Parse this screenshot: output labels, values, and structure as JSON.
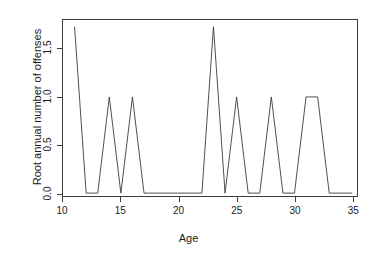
{
  "chart_data": {
    "type": "line",
    "title": "",
    "subtitle": "",
    "xlabel": "Age",
    "ylabel": "Root annual number of offenses",
    "xlim": [
      10,
      35.4
    ],
    "ylim": [
      -0.03,
      1.8
    ],
    "grid": false,
    "legend": null,
    "legend_position": "none",
    "x_ticks": [
      10,
      15,
      20,
      25,
      30,
      35
    ],
    "x_tick_labels": [
      "10",
      "15",
      "20",
      "25",
      "30",
      "35"
    ],
    "y_ticks": [
      0.0,
      0.5,
      1.0,
      1.5
    ],
    "y_tick_labels": [
      "0.0",
      "0.5",
      "1.0",
      "1.5"
    ],
    "line_color": "#3c3c3c",
    "line_width": 0.9,
    "frame_color": "#3c3c3c",
    "background_color": "#ffffff",
    "x": [
      11,
      12,
      13,
      14,
      15,
      16,
      17,
      18,
      19,
      20,
      21,
      22,
      23,
      24,
      25,
      26,
      27,
      28,
      29,
      30,
      31,
      32,
      33,
      34,
      35
    ],
    "values": [
      1.73,
      0.0,
      0.0,
      1.0,
      0.0,
      1.0,
      0.0,
      0.0,
      0.0,
      0.0,
      0.0,
      0.0,
      1.73,
      0.0,
      1.0,
      0.0,
      0.0,
      1.0,
      0.0,
      0.0,
      1.0,
      1.0,
      0.0,
      0.0,
      0.0
    ],
    "series": [
      {
        "name": "Root annual number of offenses",
        "values": [
          1.73,
          0.0,
          0.0,
          1.0,
          0.0,
          1.0,
          0.0,
          0.0,
          0.0,
          0.0,
          0.0,
          0.0,
          1.73,
          0.0,
          1.0,
          0.0,
          0.0,
          1.0,
          0.0,
          0.0,
          1.0,
          1.0,
          0.0,
          0.0,
          0.0
        ]
      }
    ]
  }
}
